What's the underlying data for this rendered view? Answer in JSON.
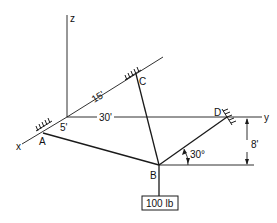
{
  "diagram": {
    "title": "",
    "axes": {
      "x_label": "x",
      "y_label": "y",
      "z_label": "z"
    },
    "points": {
      "A": "A",
      "B": "B",
      "C": "C",
      "D": "D"
    },
    "dimensions": {
      "origin_to_A": "5'",
      "origin_to_C": "15'",
      "origin_to_D": "30'",
      "D_height_above_B": "8'",
      "angle_BD": "30°"
    },
    "load": {
      "label": "100 lb"
    },
    "colors": {
      "ink": "#1a1a1a",
      "background": "#ffffff"
    }
  }
}
